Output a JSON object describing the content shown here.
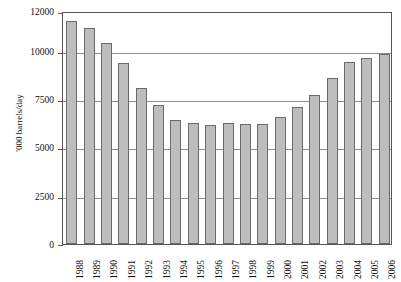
{
  "chart_data": {
    "type": "bar",
    "title": "",
    "xlabel": "",
    "ylabel": "'000 barrels/day",
    "ylim": [
      0,
      12000
    ],
    "grid": true,
    "legend": "none",
    "ytick_labels": [
      "0",
      "2500",
      "5000",
      "7500",
      "10000",
      "12000"
    ],
    "yticks": [
      0,
      2500,
      5000,
      7500,
      10000,
      12000
    ],
    "categories": [
      "1988",
      "1989",
      "1990",
      "1991",
      "1992",
      "1993",
      "1994",
      "1995",
      "1996",
      "1997",
      "1998",
      "1999",
      "2000",
      "2001",
      "2002",
      "2003",
      "2004",
      "2005",
      "2006"
    ],
    "values": [
      11480,
      11130,
      10350,
      9330,
      8020,
      7160,
      6400,
      6250,
      6140,
      6250,
      6180,
      6200,
      6550,
      7080,
      7700,
      8550,
      9350,
      9600,
      9800
    ],
    "bar_color": "#bdbdbd",
    "bar_border_color": "#6a6a6a",
    "grid_color": "#8e8e8e",
    "axis_color": "#555555"
  }
}
